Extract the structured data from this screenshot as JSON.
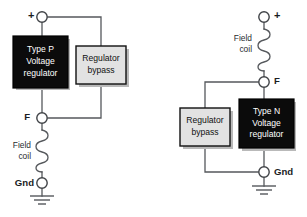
{
  "figure": {
    "type": "schematic-diagram",
    "background_color": "#ffffff",
    "wire_color": "#55585c",
    "black_box_color": "#0b0b0b",
    "gray_box_color": "#e2e2e2"
  },
  "circuits": [
    {
      "id": "type-p",
      "regulator": {
        "line1": "Type P",
        "line2": "Voltage",
        "line3": "regulator",
        "fill": "black"
      },
      "bypass": {
        "line1": "Regulator",
        "line2": "bypass",
        "fill": "gray"
      },
      "field_coil": {
        "line1": "Field",
        "line2": "coil"
      },
      "terminals": {
        "positive": "+",
        "field": "F",
        "ground": "Gnd"
      }
    },
    {
      "id": "type-n",
      "regulator": {
        "line1": "Type N",
        "line2": "Voltage",
        "line3": "regulator",
        "fill": "black"
      },
      "bypass": {
        "line1": "Regulator",
        "line2": "bypass",
        "fill": "gray"
      },
      "field_coil": {
        "line1": "Field",
        "line2": "coil"
      },
      "terminals": {
        "positive": "+",
        "field": "F",
        "ground": "Gnd"
      }
    }
  ]
}
